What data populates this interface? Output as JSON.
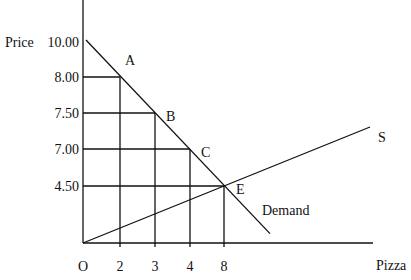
{
  "chart_data": {
    "type": "line",
    "title": "",
    "xlabel": "Pizza",
    "ylabel": "Price",
    "origin_label": "O",
    "x_ticks": [
      {
        "value": 2,
        "label": "2"
      },
      {
        "value": 3,
        "label": "3"
      },
      {
        "value": 4,
        "label": "4"
      },
      {
        "value": 8,
        "label": "8"
      }
    ],
    "y_ticks": [
      {
        "value": 10.0,
        "label": "10.00"
      },
      {
        "value": 8.0,
        "label": "8.00"
      },
      {
        "value": 7.5,
        "label": "7.50"
      },
      {
        "value": 7.0,
        "label": "7.00"
      },
      {
        "value": 4.5,
        "label": "4.50"
      }
    ],
    "series": [
      {
        "name": "Demand",
        "label": "Demand",
        "points": [
          {
            "label": "",
            "x": 0,
            "y": 10.0
          },
          {
            "label": "A",
            "x": 2,
            "y": 8.0
          },
          {
            "label": "B",
            "x": 3,
            "y": 7.5
          },
          {
            "label": "C",
            "x": 4,
            "y": 7.0
          },
          {
            "label": "E",
            "x": 8,
            "y": 4.5
          }
        ]
      },
      {
        "name": "Supply",
        "label": "S",
        "points": [
          {
            "label": "O",
            "x": 0,
            "y": 0
          },
          {
            "label": "E",
            "x": 8,
            "y": 4.5
          }
        ]
      }
    ],
    "guide_points": [
      "A",
      "B",
      "C",
      "E"
    ],
    "grid": false,
    "note": "Axis spacing is categorical (ticks evenly spaced), not proportional to values"
  }
}
